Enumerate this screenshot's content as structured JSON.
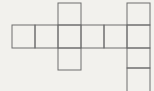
{
  "canvas": {
    "width": 154,
    "height": 91,
    "background_color": "#f2f1ed",
    "line_color": "#6e6e6e",
    "line_width": 1
  },
  "figure": {
    "name": "net-of-squares-diagram",
    "cell_size": 23,
    "squares": [
      {
        "x": 12,
        "y": 25,
        "w": 23,
        "h": 23
      },
      {
        "x": 35,
        "y": 25,
        "w": 23,
        "h": 23
      },
      {
        "x": 58,
        "y": 25,
        "w": 23,
        "h": 23
      },
      {
        "x": 81,
        "y": 25,
        "w": 23,
        "h": 23
      },
      {
        "x": 104,
        "y": 25,
        "w": 23,
        "h": 23
      },
      {
        "x": 127,
        "y": 25,
        "w": 23,
        "h": 23
      },
      {
        "x": 58,
        "y": 3,
        "w": 23,
        "h": 22
      },
      {
        "x": 58,
        "y": 48,
        "w": 23,
        "h": 22
      },
      {
        "x": 127,
        "y": 3,
        "w": 23,
        "h": 22
      },
      {
        "x": 127,
        "y": 48,
        "w": 23,
        "h": 20
      },
      {
        "x": 127,
        "y": 68,
        "w": 23,
        "h": 25
      }
    ]
  }
}
